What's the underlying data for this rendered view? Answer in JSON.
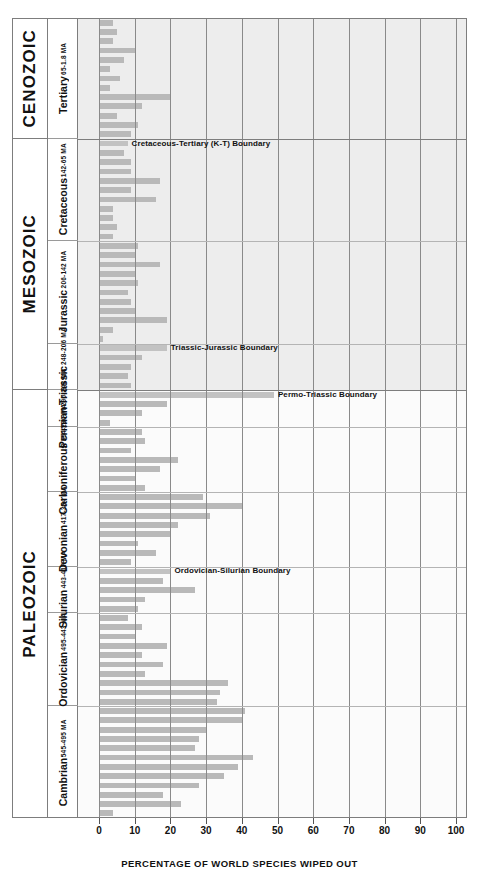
{
  "chart_data": {
    "type": "bar",
    "title": "",
    "xlabel": "PERCENTAGE OF WORLD SPECIES WIPED OUT",
    "ylabel": "",
    "xlim": [
      0,
      100
    ],
    "xticks": [
      0,
      10,
      20,
      30,
      40,
      50,
      60,
      70,
      80,
      90,
      100
    ],
    "orientation": "horizontal",
    "grid": true,
    "legend": "none",
    "bar_color": "#b9b9b9",
    "eras": [
      {
        "name": "CENOZOIC",
        "periods": [
          {
            "name": "Tertiary",
            "age": "65-1.8 MA",
            "values": [
              4,
              5,
              4,
              10,
              7,
              3,
              6,
              3,
              20,
              12,
              5,
              11,
              9
            ]
          }
        ]
      },
      {
        "name": "MESOZOIC",
        "periods": [
          {
            "name": "Cretaceous",
            "age": "142-65 MA",
            "values": [
              8,
              7,
              9,
              9,
              17,
              9,
              16,
              4,
              4,
              5,
              4
            ]
          },
          {
            "name": "Jurassic",
            "age": "206-142 MA",
            "values": [
              11,
              10,
              17,
              10,
              11,
              8,
              9,
              10,
              19,
              4,
              1
            ]
          },
          {
            "name": "Triassic",
            "age": "248-206 MA",
            "values": [
              19,
              12,
              9,
              8,
              9
            ]
          }
        ]
      },
      {
        "name": "PALEOZOIC",
        "periods": [
          {
            "name": "Permian",
            "age": "290-248 MA",
            "values": [
              49,
              19,
              12,
              3
            ]
          },
          {
            "name": "Carboniferous",
            "age": "354-290 MA",
            "values": [
              12,
              13,
              9,
              22,
              17,
              10,
              13
            ]
          },
          {
            "name": "Devonian",
            "age": "417-354 MA",
            "values": [
              29,
              40,
              31,
              22,
              20,
              11,
              16,
              9
            ]
          },
          {
            "name": "Silurian",
            "age": "443-417 MA",
            "values": [
              20,
              18,
              27,
              13,
              11
            ]
          },
          {
            "name": "Ordovician",
            "age": "495-443 MA",
            "values": [
              8,
              12,
              10,
              19,
              12,
              18,
              13,
              36,
              34,
              33
            ]
          },
          {
            "name": "Cambrian",
            "age": "545-495 MA",
            "values": [
              41,
              40,
              30,
              28,
              27,
              43,
              39,
              35,
              28,
              18,
              23,
              4
            ]
          }
        ]
      }
    ],
    "annotations": [
      {
        "label": "Cretaceous-Tertiary (K-T) Boundary",
        "value": 20
      },
      {
        "label": "Triassic-Jurassic Boundary",
        "value": 20
      },
      {
        "label": "Permo-Triassic Boundary",
        "value": 49
      },
      {
        "label": "Ordovician-Silurian Boundary",
        "value": 20
      }
    ]
  }
}
